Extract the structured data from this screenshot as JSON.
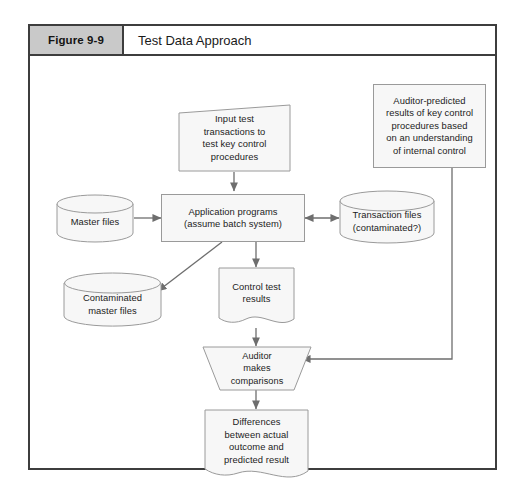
{
  "figure": {
    "number": "Figure 9-9",
    "title": "Test Data Approach"
  },
  "diagram": {
    "nodes": {
      "input_test_transactions": "Input test transactions to test key control procedures",
      "auditor_predicted_results": "Auditor-predicted results of key control procedures based on an understanding of internal control",
      "master_files": "Master files",
      "application_programs": "Application programs (assume batch system)",
      "transaction_files": "Transaction files (contaminated?)",
      "contaminated_master_files": "Contaminated master files",
      "control_test_results": "Control test results",
      "auditor_makes_comparisons": "Auditor makes comparisons",
      "differences": "Differences between actual outcome and predicted result"
    },
    "node_lines": {
      "input_test_transactions": [
        "Input test",
        "transactions to",
        "test key control",
        "procedures"
      ],
      "auditor_predicted_results": [
        "Auditor-predicted",
        "results of key control",
        "procedures based",
        "on an understanding",
        "of internal control"
      ],
      "master_files": [
        "Master files"
      ],
      "application_programs": [
        "Application programs",
        "(assume batch system)"
      ],
      "transaction_files": [
        "Transaction files",
        "(contaminated?)"
      ],
      "contaminated_master_files": [
        "Contaminated",
        "master files"
      ],
      "control_test_results": [
        "Control test",
        "results"
      ],
      "auditor_makes_comparisons": [
        "Auditor",
        "makes",
        "comparisons"
      ],
      "differences": [
        "Differences",
        "between actual",
        "outcome and",
        "predicted result"
      ]
    },
    "shapes": {
      "input_test_transactions": "input-parallelogram-slanted-top",
      "auditor_predicted_results": "rectangle",
      "master_files": "cylinder-database",
      "application_programs": "rectangle",
      "transaction_files": "cylinder-database",
      "contaminated_master_files": "cylinder-database",
      "control_test_results": "document-wavy-bottom",
      "auditor_makes_comparisons": "trapezoid-manual-operation",
      "differences": "document-wavy-bottom"
    },
    "connectors": [
      {
        "from": "input_test_transactions",
        "to": "application_programs",
        "style": "arrow-down"
      },
      {
        "from": "auditor_predicted_results",
        "to": "auditor_makes_comparisons",
        "style": "elbow-right-then-left-arrow"
      },
      {
        "from": "master_files",
        "to": "application_programs",
        "style": "arrow-right"
      },
      {
        "from": "application_programs",
        "to": "transaction_files",
        "style": "double-headed-arrow-horizontal"
      },
      {
        "from": "application_programs",
        "to": "contaminated_master_files",
        "style": "diagonal-arrow-down-left"
      },
      {
        "from": "application_programs",
        "to": "control_test_results",
        "style": "arrow-down"
      },
      {
        "from": "control_test_results",
        "to": "auditor_makes_comparisons",
        "style": "arrow-down"
      },
      {
        "from": "auditor_makes_comparisons",
        "to": "differences",
        "style": "arrow-down"
      }
    ]
  },
  "colors": {
    "frame_border": "#3d3d3d",
    "header_gray": "#c9c9c9",
    "shape_fill": "#f7f7f7",
    "shape_stroke": "#9a9a9a",
    "connector": "#6e6e6e",
    "text": "#1c1c1c",
    "page_background": "#ffffff"
  }
}
